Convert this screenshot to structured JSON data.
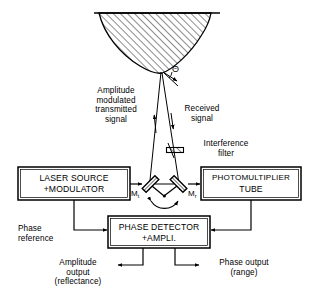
{
  "figure": {
    "target": {
      "name": "hatched-target-surface",
      "angle_symbol": "Θ"
    },
    "beams": {
      "transmitted_label": "Amplitude\nmodulated\ntransmitted\nsignal",
      "received_label": "Received\nsignal",
      "filter_label": "Interference\nfilter"
    },
    "mirrors": [
      {
        "id": "mt",
        "label": "M",
        "subscript": "t"
      },
      {
        "id": "mr",
        "label": "M",
        "subscript": "r"
      }
    ],
    "boxes": [
      {
        "id": "laser-source",
        "line1": "LASER SOURCE",
        "line2": "+MODULATOR"
      },
      {
        "id": "photomultiplier",
        "line1": "PHOTOMULTIPLIER",
        "line2": "TUBE"
      },
      {
        "id": "phase-detector",
        "line1": "PHASE DETECTOR",
        "line2": "+AMPLI."
      }
    ],
    "signals": {
      "phase_reference": "Phase\nreference",
      "amplitude_output": "Amplitude\noutput\n(reflectance)",
      "phase_output": "Phase output\n(range)"
    },
    "colors": {
      "ink": "#000000",
      "paper": "#ffffff"
    }
  }
}
